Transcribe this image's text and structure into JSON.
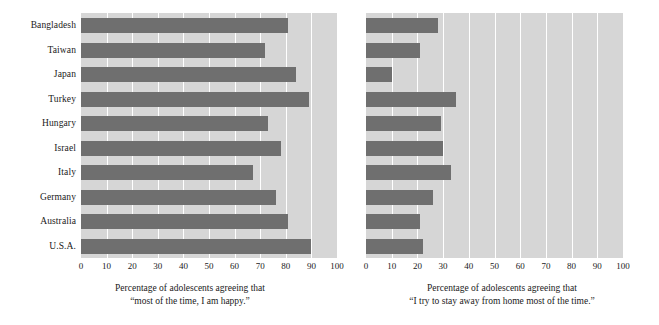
{
  "chart_data": {
    "type": "bar",
    "orientation": "horizontal",
    "title": "",
    "categories": [
      "Bangladesh",
      "Taiwan",
      "Japan",
      "Turkey",
      "Hungary",
      "Israel",
      "Italy",
      "Germany",
      "Australia",
      "U.S.A."
    ],
    "panels": [
      {
        "id": "happy",
        "xlabel_line1": "Percentage of adolescents agreeing that",
        "xlabel_line2": "“most of the time, I am happy.”",
        "xlabel": "Percentage of adolescents agreeing that “most of the time, I am happy.”",
        "values": [
          81,
          72,
          84,
          89,
          73,
          78,
          67,
          76,
          81,
          90
        ],
        "xlim": [
          0,
          100
        ],
        "xticks": [
          0,
          10,
          20,
          30,
          40,
          50,
          60,
          70,
          80,
          90,
          100
        ]
      },
      {
        "id": "stay-away-from-home",
        "xlabel_line1": "Percentage of adolescents agreeing that",
        "xlabel_line2": "“I try to stay away from home most of the time.”",
        "xlabel": "Percentage of adolescents agreeing that “I try to stay away from home most of the time.”",
        "values": [
          28,
          21,
          10,
          35,
          29,
          30,
          33,
          26,
          21,
          22
        ],
        "xlim": [
          0,
          100
        ],
        "xticks": [
          0,
          10,
          20,
          30,
          40,
          50,
          60,
          70,
          80,
          90,
          100
        ]
      }
    ],
    "grid": true,
    "gridline_color": "#ffffff",
    "legend": null,
    "colors": {
      "bar": "#6f6f6f",
      "plot_background": "#d6d6d6",
      "figure_background": "#ffffff",
      "gridline": "#ffffff",
      "text": "#1a1a1a"
    }
  }
}
